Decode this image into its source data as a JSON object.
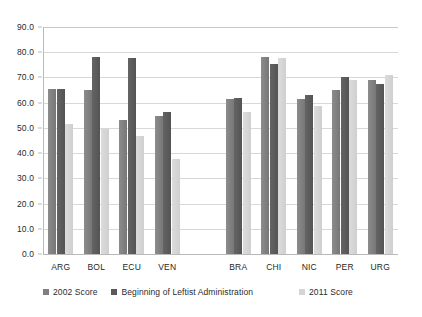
{
  "chart_data": {
    "type": "bar",
    "title": "",
    "subtitle": "",
    "xlabel": "",
    "ylabel": "",
    "ylim": [
      0.0,
      90.0
    ],
    "ytick_step": 10.0,
    "ytick_labels": [
      "0.0",
      "10.0",
      "20.0",
      "30.0",
      "40.0",
      "50.0",
      "60.0",
      "70.0",
      "80.0",
      "90.0"
    ],
    "grid": "horizontal",
    "legend_position": "bottom",
    "group_gap_after": "VEN",
    "categories": [
      "ARG",
      "BOL",
      "ECU",
      "VEN",
      "BRA",
      "CHI",
      "NIC",
      "PER",
      "URG"
    ],
    "series": [
      {
        "name": "2002 Score",
        "color": "#808080",
        "values": [
          65.5,
          65.1,
          53.0,
          54.7,
          61.6,
          78.2,
          61.4,
          64.9,
          69.1
        ]
      },
      {
        "name": "Beginning of Leftist Administration",
        "color": "#595959",
        "values": [
          65.6,
          78.1,
          77.8,
          56.2,
          61.8,
          75.2,
          63.0,
          70.0,
          67.4
        ]
      },
      {
        "name": "2011 Score",
        "color": "#d5d5d5",
        "values": [
          51.4,
          49.7,
          46.8,
          37.8,
          56.3,
          77.8,
          58.7,
          68.9,
          71.0
        ]
      }
    ]
  },
  "watermark": {
    "text": ""
  }
}
